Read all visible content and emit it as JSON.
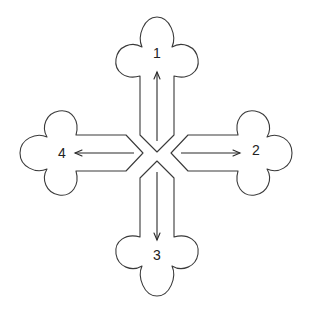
{
  "diagram": {
    "arms": [
      {
        "id": 1,
        "label": "1",
        "direction": "up"
      },
      {
        "id": 2,
        "label": "2",
        "direction": "right"
      },
      {
        "id": 3,
        "label": "3",
        "direction": "down"
      },
      {
        "id": 4,
        "label": "4",
        "direction": "left"
      }
    ],
    "colors": {
      "stroke": "#3a3a3a",
      "background": "#ffffff",
      "text": "#222222"
    }
  }
}
